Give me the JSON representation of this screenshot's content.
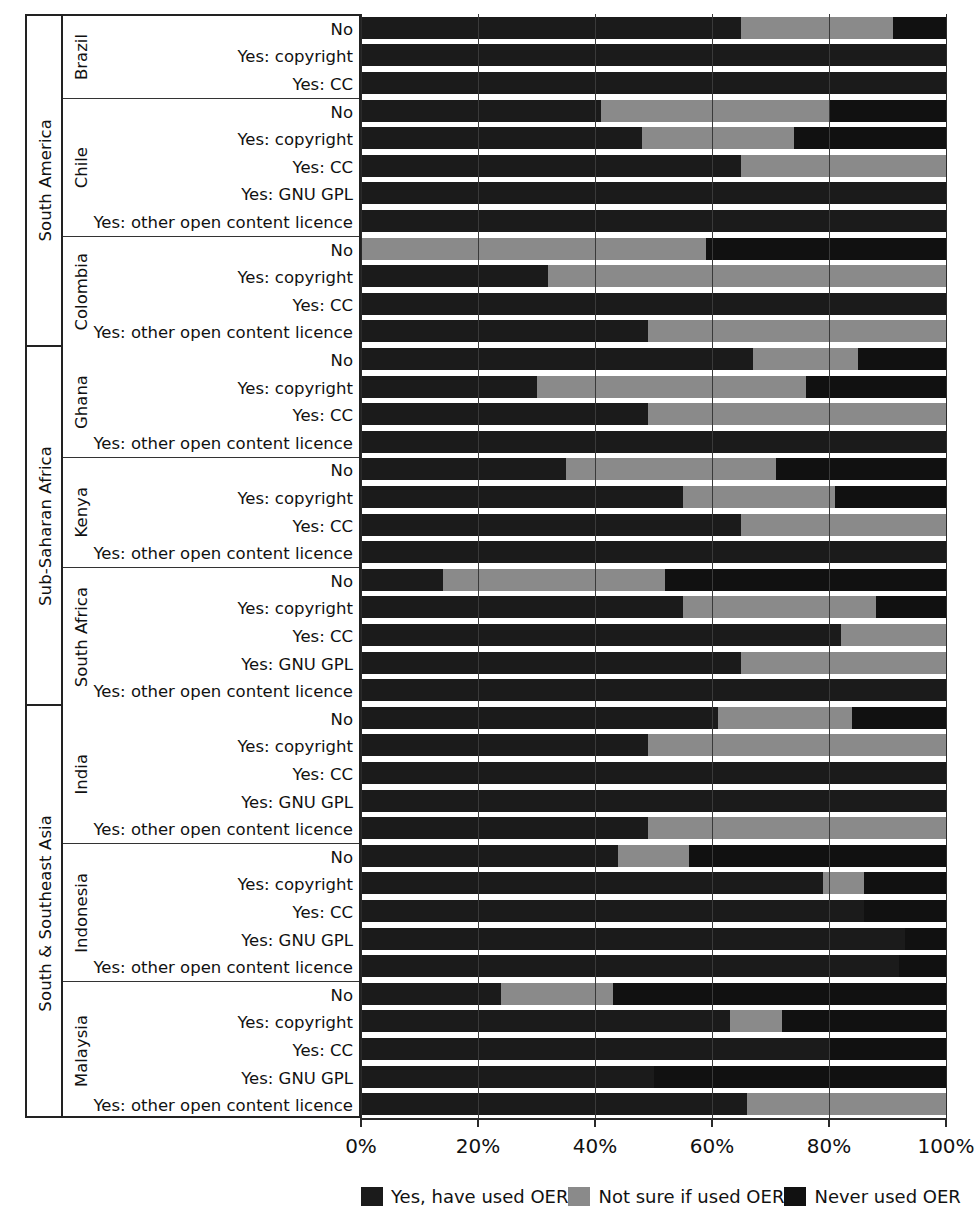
{
  "axis": {
    "ticks": [
      0,
      20,
      40,
      60,
      80,
      100
    ],
    "tick_labels": [
      "0%",
      "20%",
      "40%",
      "60%",
      "80%",
      "100%"
    ],
    "xlabel": ""
  },
  "legend": {
    "position": "bottom",
    "items": [
      {
        "key": "used",
        "label": "Yes, have used OER",
        "color": "#1b1b1b"
      },
      {
        "key": "notsure",
        "label": "Not sure if used OER",
        "color": "#8a8a8a"
      },
      {
        "key": "never",
        "label": "Never used OER",
        "color": "#111111"
      }
    ]
  },
  "chart_data": {
    "type": "bar",
    "orientation": "horizontal",
    "stacked": true,
    "normalized": true,
    "title": "",
    "xlabel": "",
    "ylabel": "",
    "xlim": [
      0,
      100
    ],
    "grid": true,
    "series": [
      {
        "name": "Yes, have used OER",
        "key": "used",
        "color": "#1b1b1b"
      },
      {
        "name": "Not sure if used OER",
        "key": "notsure",
        "color": "#8a8a8a"
      },
      {
        "name": "Never used OER",
        "key": "never",
        "color": "#111111"
      }
    ],
    "regions": [
      {
        "region": "South America",
        "countries": [
          {
            "country": "Brazil",
            "rows": [
              {
                "label": "No",
                "values": [
                  65,
                  26,
                  9
                ]
              },
              {
                "label": "Yes: copyright",
                "values": [
                  100,
                  0,
                  0
                ]
              },
              {
                "label": "Yes: CC",
                "values": [
                  100,
                  0,
                  0
                ]
              }
            ]
          },
          {
            "country": "Chile",
            "rows": [
              {
                "label": "No",
                "values": [
                  41,
                  39,
                  20
                ]
              },
              {
                "label": "Yes: copyright",
                "values": [
                  48,
                  26,
                  26
                ]
              },
              {
                "label": "Yes: CC",
                "values": [
                  65,
                  35,
                  0
                ]
              },
              {
                "label": "Yes: GNU GPL",
                "values": [
                  100,
                  0,
                  0
                ]
              },
              {
                "label": "Yes: other open content licence",
                "values": [
                  100,
                  0,
                  0
                ]
              }
            ]
          },
          {
            "country": "Colombia",
            "rows": [
              {
                "label": "No",
                "values": [
                  0,
                  59,
                  41
                ]
              },
              {
                "label": "Yes: copyright",
                "values": [
                  32,
                  68,
                  0
                ]
              },
              {
                "label": "Yes: CC",
                "values": [
                  100,
                  0,
                  0
                ]
              },
              {
                "label": "Yes: other open content licence",
                "values": [
                  49,
                  51,
                  0
                ]
              }
            ]
          }
        ]
      },
      {
        "region": "Sub-Saharan Africa",
        "countries": [
          {
            "country": "Ghana",
            "rows": [
              {
                "label": "No",
                "values": [
                  67,
                  18,
                  15
                ]
              },
              {
                "label": "Yes: copyright",
                "values": [
                  30,
                  46,
                  24
                ]
              },
              {
                "label": "Yes: CC",
                "values": [
                  49,
                  51,
                  0
                ]
              },
              {
                "label": "Yes: other open content licence",
                "values": [
                  100,
                  0,
                  0
                ]
              }
            ]
          },
          {
            "country": "Kenya",
            "rows": [
              {
                "label": "No",
                "values": [
                  35,
                  36,
                  29
                ]
              },
              {
                "label": "Yes: copyright",
                "values": [
                  55,
                  26,
                  19
                ]
              },
              {
                "label": "Yes: CC",
                "values": [
                  65,
                  35,
                  0
                ]
              },
              {
                "label": "Yes: other open content licence",
                "values": [
                  100,
                  0,
                  0
                ]
              }
            ]
          },
          {
            "country": "South Africa",
            "rows": [
              {
                "label": "No",
                "values": [
                  14,
                  38,
                  48
                ]
              },
              {
                "label": "Yes: copyright",
                "values": [
                  55,
                  33,
                  12
                ]
              },
              {
                "label": "Yes: CC",
                "values": [
                  82,
                  18,
                  0
                ]
              },
              {
                "label": "Yes: GNU GPL",
                "values": [
                  65,
                  35,
                  0
                ]
              },
              {
                "label": "Yes: other open content licence",
                "values": [
                  100,
                  0,
                  0
                ]
              }
            ]
          }
        ]
      },
      {
        "region": "South & Southeast Asia",
        "countries": [
          {
            "country": "India",
            "rows": [
              {
                "label": "No",
                "values": [
                  61,
                  23,
                  16
                ]
              },
              {
                "label": "Yes: copyright",
                "values": [
                  49,
                  51,
                  0
                ]
              },
              {
                "label": "Yes: CC",
                "values": [
                  100,
                  0,
                  0
                ]
              },
              {
                "label": "Yes: GNU GPL",
                "values": [
                  100,
                  0,
                  0
                ]
              },
              {
                "label": "Yes: other open content licence",
                "values": [
                  49,
                  51,
                  0
                ]
              }
            ]
          },
          {
            "country": "Indonesia",
            "rows": [
              {
                "label": "No",
                "values": [
                  44,
                  12,
                  44
                ]
              },
              {
                "label": "Yes: copyright",
                "values": [
                  79,
                  7,
                  14
                ]
              },
              {
                "label": "Yes: CC",
                "values": [
                  86,
                  0,
                  14
                ]
              },
              {
                "label": "Yes: GNU GPL",
                "values": [
                  93,
                  0,
                  7
                ]
              },
              {
                "label": "Yes: other open content licence",
                "values": [
                  92,
                  0,
                  8
                ]
              }
            ]
          },
          {
            "country": "Malaysia",
            "rows": [
              {
                "label": "No",
                "values": [
                  24,
                  19,
                  57
                ]
              },
              {
                "label": "Yes: copyright",
                "values": [
                  63,
                  9,
                  28
                ]
              },
              {
                "label": "Yes: CC",
                "values": [
                  80,
                  0,
                  20
                ]
              },
              {
                "label": "Yes: GNU GPL",
                "values": [
                  50,
                  0,
                  50
                ]
              },
              {
                "label": "Yes: other open content licence",
                "values": [
                  66,
                  34,
                  0
                ]
              }
            ]
          }
        ]
      }
    ]
  }
}
